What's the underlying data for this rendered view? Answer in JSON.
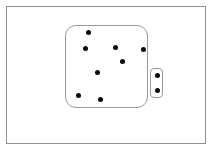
{
  "canvas": {
    "width": 212,
    "height": 150,
    "background": "#ffffff"
  },
  "frame": {
    "label": "outer-frame",
    "x": 6,
    "y": 6,
    "width": 200,
    "height": 138,
    "border_color": "#8e8e8e",
    "border_width": 1,
    "fill": "#ffffff"
  },
  "main_shape": {
    "label": "main-rounded-rect",
    "x": 65,
    "y": 25,
    "width": 83,
    "height": 83,
    "radius": 11,
    "border_color": "#9a9a9a",
    "border_width": 1,
    "fill": "#ffffff",
    "dot_count": 8
  },
  "side_shape": {
    "label": "side-rounded-rect",
    "x": 150,
    "y": 68,
    "width": 13,
    "height": 30,
    "radius": 4,
    "border_color": "#9a9a9a",
    "border_width": 1,
    "fill": "#ffffff",
    "dot_count": 2
  },
  "dot_style": {
    "color": "#0b0b0b",
    "diameter": 5
  },
  "chart_data": {
    "type": "scatter",
    "title": "",
    "xlabel": "",
    "ylabel": "",
    "xlim": [
      0,
      212
    ],
    "ylim": [
      0,
      150
    ],
    "grid": false,
    "legend": false,
    "series": [
      {
        "name": "main-region-points",
        "color": "#0b0b0b",
        "marker_size": 5,
        "points": [
          {
            "x": 88,
            "y": 32
          },
          {
            "x": 85,
            "y": 48
          },
          {
            "x": 115,
            "y": 47
          },
          {
            "x": 143,
            "y": 49
          },
          {
            "x": 122,
            "y": 61
          },
          {
            "x": 97,
            "y": 72
          },
          {
            "x": 78,
            "y": 95
          },
          {
            "x": 100,
            "y": 99
          }
        ]
      },
      {
        "name": "side-region-points",
        "color": "#0b0b0b",
        "marker_size": 5,
        "points": [
          {
            "x": 157,
            "y": 75
          },
          {
            "x": 157,
            "y": 90
          }
        ]
      }
    ]
  }
}
